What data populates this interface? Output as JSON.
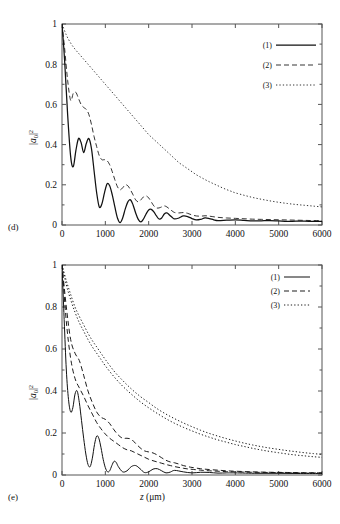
{
  "figure": {
    "panels": [
      {
        "id": "d",
        "label": "(d)",
        "ylabel_html": "|<i>a</i><sub>0</sub>|<sup>2</sup>",
        "xlabel": "",
        "legend": [
          {
            "key": "(1)",
            "style": "solid"
          },
          {
            "key": "(2)",
            "style": "dashed"
          },
          {
            "key": "(3)",
            "style": "dotted"
          }
        ]
      },
      {
        "id": "e",
        "label": "(e)",
        "ylabel_html": "|<i>a</i><sub>0</sub>|<sup>2</sup>",
        "xlabel_html": "<i>z</i> (μm)",
        "legend": [
          {
            "key": "(1)",
            "style": "solid"
          },
          {
            "key": "(2)",
            "style": "dashed"
          },
          {
            "key": "(3)",
            "style": "dotted"
          }
        ]
      }
    ],
    "axis": {
      "x_ticks": [
        "0",
        "1000",
        "2000",
        "3000",
        "4000",
        "5000",
        "6000"
      ],
      "y_ticks": [
        "0",
        "0.2",
        "0.4",
        "0.6",
        "0.8",
        "1"
      ],
      "x_values": [
        0,
        1000,
        2000,
        3000,
        4000,
        5000,
        6000
      ],
      "y_values": [
        0,
        0.2,
        0.4,
        0.6,
        0.8,
        1
      ],
      "xlim": [
        0,
        6000
      ],
      "ylim": [
        0,
        1
      ]
    },
    "colors": {
      "line": "#111111",
      "frame": "#555555",
      "background": "#ffffff"
    }
  },
  "chart_data": [
    {
      "type": "line",
      "panel": "d",
      "title": "",
      "xlabel": "z (μm)",
      "ylabel": "|a_0|^2",
      "xlim": [
        0,
        6000
      ],
      "ylim": [
        0,
        1
      ],
      "grid": false,
      "legend_position": "top-right",
      "series": [
        {
          "name": "(1)",
          "style": "solid",
          "x": [
            0,
            60,
            130,
            200,
            260,
            320,
            380,
            440,
            500,
            560,
            620,
            680,
            740,
            800,
            860,
            920,
            980,
            1040,
            1100,
            1160,
            1220,
            1280,
            1340,
            1400,
            1460,
            1520,
            1580,
            1640,
            1700,
            1760,
            1820,
            1880,
            1940,
            2000,
            2060,
            2120,
            2180,
            2240,
            2300,
            2360,
            2420,
            2480,
            2540,
            2600,
            2700,
            2800,
            2900,
            3000,
            3100,
            3200,
            3300,
            3400,
            3500,
            3600,
            3800,
            4000,
            4200,
            4400,
            4600,
            4800,
            5000,
            5200,
            5400,
            5600,
            5800,
            6000
          ],
          "y": [
            1.0,
            0.82,
            0.55,
            0.34,
            0.29,
            0.37,
            0.43,
            0.41,
            0.36,
            0.405,
            0.43,
            0.38,
            0.27,
            0.16,
            0.09,
            0.105,
            0.16,
            0.205,
            0.195,
            0.15,
            0.09,
            0.035,
            0.012,
            0.035,
            0.08,
            0.115,
            0.125,
            0.1,
            0.06,
            0.028,
            0.015,
            0.03,
            0.055,
            0.075,
            0.078,
            0.065,
            0.045,
            0.03,
            0.035,
            0.055,
            0.06,
            0.05,
            0.038,
            0.03,
            0.035,
            0.045,
            0.042,
            0.032,
            0.025,
            0.028,
            0.035,
            0.032,
            0.026,
            0.022,
            0.024,
            0.026,
            0.023,
            0.02,
            0.021,
            0.022,
            0.02,
            0.018,
            0.019,
            0.019,
            0.018,
            0.018
          ]
        },
        {
          "name": "(2)",
          "style": "dashed",
          "x": [
            0,
            60,
            130,
            200,
            260,
            320,
            380,
            440,
            500,
            560,
            620,
            680,
            740,
            800,
            860,
            920,
            980,
            1040,
            1100,
            1160,
            1220,
            1280,
            1340,
            1400,
            1460,
            1520,
            1580,
            1640,
            1700,
            1760,
            1820,
            1880,
            1940,
            2000,
            2060,
            2120,
            2180,
            2240,
            2300,
            2360,
            2420,
            2480,
            2540,
            2600,
            2700,
            2800,
            2900,
            3000,
            3100,
            3200,
            3300,
            3400,
            3600,
            3800,
            4000,
            4200,
            4400,
            4600,
            4800,
            5000,
            5200,
            5400,
            5600,
            5800,
            6000
          ],
          "y": [
            1.0,
            0.88,
            0.72,
            0.62,
            0.655,
            0.66,
            0.63,
            0.6,
            0.585,
            0.575,
            0.55,
            0.5,
            0.44,
            0.39,
            0.345,
            0.325,
            0.325,
            0.32,
            0.3,
            0.265,
            0.225,
            0.19,
            0.175,
            0.185,
            0.2,
            0.195,
            0.175,
            0.15,
            0.125,
            0.115,
            0.125,
            0.14,
            0.145,
            0.135,
            0.115,
            0.095,
            0.085,
            0.085,
            0.09,
            0.095,
            0.09,
            0.08,
            0.07,
            0.062,
            0.06,
            0.062,
            0.058,
            0.05,
            0.045,
            0.044,
            0.046,
            0.044,
            0.038,
            0.035,
            0.033,
            0.031,
            0.029,
            0.028,
            0.027,
            0.026,
            0.025,
            0.024,
            0.023,
            0.022,
            0.022
          ]
        },
        {
          "name": "(3)",
          "style": "dotted",
          "x": [
            0,
            100,
            200,
            300,
            400,
            500,
            600,
            700,
            800,
            900,
            1000,
            1100,
            1200,
            1300,
            1400,
            1500,
            1600,
            1700,
            1800,
            1900,
            2000,
            2100,
            2200,
            2300,
            2400,
            2500,
            2600,
            2700,
            2800,
            2900,
            3000,
            3100,
            3200,
            3300,
            3400,
            3500,
            3600,
            3700,
            3800,
            3900,
            4000,
            4200,
            4400,
            4600,
            4800,
            5000,
            5200,
            5400,
            5600,
            5800,
            6000
          ],
          "y": [
            1.0,
            0.945,
            0.905,
            0.875,
            0.85,
            0.825,
            0.8,
            0.775,
            0.75,
            0.725,
            0.7,
            0.675,
            0.65,
            0.625,
            0.6,
            0.575,
            0.55,
            0.525,
            0.5,
            0.475,
            0.45,
            0.43,
            0.41,
            0.39,
            0.37,
            0.35,
            0.33,
            0.31,
            0.295,
            0.28,
            0.265,
            0.25,
            0.238,
            0.226,
            0.215,
            0.205,
            0.195,
            0.185,
            0.176,
            0.168,
            0.16,
            0.148,
            0.137,
            0.128,
            0.12,
            0.113,
            0.107,
            0.102,
            0.098,
            0.094,
            0.09
          ]
        }
      ]
    },
    {
      "type": "line",
      "panel": "e",
      "title": "",
      "xlabel": "z (μm)",
      "ylabel": "|a_0|^2",
      "xlim": [
        0,
        6000
      ],
      "ylim": [
        0,
        1
      ],
      "grid": false,
      "legend_position": "top-right",
      "series": [
        {
          "name": "(1)",
          "style": "solid",
          "x": [
            0,
            50,
            100,
            150,
            200,
            250,
            300,
            350,
            400,
            450,
            500,
            550,
            600,
            650,
            700,
            750,
            800,
            850,
            900,
            950,
            1000,
            1050,
            1100,
            1150,
            1200,
            1250,
            1300,
            1400,
            1500,
            1600,
            1700,
            1800,
            1900,
            2000,
            2100,
            2200,
            2300,
            2400,
            2500,
            2600,
            2800,
            3000,
            3200,
            3400,
            3600,
            3800,
            4000,
            4500,
            5000,
            5500,
            6000
          ],
          "y": [
            1.0,
            0.74,
            0.5,
            0.36,
            0.3,
            0.32,
            0.385,
            0.4,
            0.345,
            0.26,
            0.175,
            0.1,
            0.05,
            0.04,
            0.08,
            0.145,
            0.185,
            0.175,
            0.13,
            0.075,
            0.035,
            0.015,
            0.02,
            0.045,
            0.065,
            0.06,
            0.04,
            0.015,
            0.02,
            0.04,
            0.045,
            0.03,
            0.012,
            0.015,
            0.028,
            0.03,
            0.02,
            0.01,
            0.014,
            0.022,
            0.015,
            0.01,
            0.013,
            0.012,
            0.009,
            0.01,
            0.01,
            0.008,
            0.008,
            0.007,
            0.007
          ]
        },
        {
          "name": "(2)",
          "style": "dashed",
          "x": [
            0,
            100,
            200,
            300,
            400,
            500,
            600,
            700,
            800,
            900,
            1000,
            1100,
            1200,
            1300,
            1400,
            1500,
            1600,
            1700,
            1800,
            1900,
            2000,
            2100,
            2200,
            2300,
            2400,
            2500,
            2600,
            2700,
            2800,
            2900,
            3000,
            3200,
            3400,
            3600,
            3800,
            4000,
            4400,
            4800,
            5200,
            5600,
            6000
          ],
          "y": [
            1.0,
            0.73,
            0.555,
            0.46,
            0.415,
            0.375,
            0.33,
            0.29,
            0.25,
            0.22,
            0.195,
            0.175,
            0.16,
            0.145,
            0.13,
            0.12,
            0.115,
            0.105,
            0.095,
            0.085,
            0.075,
            0.068,
            0.062,
            0.056,
            0.05,
            0.045,
            0.04,
            0.036,
            0.032,
            0.029,
            0.027,
            0.023,
            0.02,
            0.018,
            0.016,
            0.015,
            0.013,
            0.012,
            0.011,
            0.01,
            0.01
          ]
        },
        {
          "name": "(2b)",
          "style": "dashed",
          "x": [
            0,
            100,
            200,
            300,
            400,
            500,
            600,
            700,
            800,
            900,
            1000,
            1100,
            1200,
            1300,
            1400,
            1500,
            1600,
            1700,
            1800,
            1900,
            2000,
            2100,
            2200,
            2300,
            2400,
            2500,
            2600,
            2700,
            2800,
            2900,
            3000,
            3200,
            3400,
            3600,
            3800,
            4000,
            4400,
            4800,
            5200,
            5600,
            6000
          ],
          "y": [
            1.0,
            0.8,
            0.645,
            0.58,
            0.545,
            0.475,
            0.4,
            0.345,
            0.3,
            0.275,
            0.265,
            0.245,
            0.215,
            0.19,
            0.175,
            0.175,
            0.17,
            0.15,
            0.13,
            0.115,
            0.11,
            0.105,
            0.095,
            0.082,
            0.07,
            0.062,
            0.058,
            0.052,
            0.045,
            0.04,
            0.036,
            0.03,
            0.026,
            0.023,
            0.02,
            0.018,
            0.015,
            0.013,
            0.012,
            0.011,
            0.01
          ]
        },
        {
          "name": "(3)",
          "style": "dotted",
          "x": [
            0,
            100,
            200,
            300,
            400,
            500,
            600,
            700,
            800,
            900,
            1000,
            1200,
            1400,
            1600,
            1800,
            2000,
            2200,
            2400,
            2600,
            2800,
            3000,
            3200,
            3400,
            3600,
            3800,
            4000,
            4200,
            4400,
            4600,
            4800,
            5000,
            5200,
            5400,
            5600,
            5800,
            6000
          ],
          "y": [
            1.0,
            0.925,
            0.86,
            0.8,
            0.755,
            0.715,
            0.675,
            0.64,
            0.61,
            0.58,
            0.55,
            0.495,
            0.45,
            0.41,
            0.375,
            0.345,
            0.315,
            0.29,
            0.268,
            0.248,
            0.23,
            0.213,
            0.198,
            0.185,
            0.173,
            0.162,
            0.152,
            0.143,
            0.135,
            0.128,
            0.122,
            0.116,
            0.111,
            0.106,
            0.102,
            0.098
          ]
        },
        {
          "name": "(3b)",
          "style": "dotted",
          "x": [
            0,
            100,
            200,
            300,
            400,
            500,
            600,
            700,
            800,
            900,
            1000,
            1200,
            1400,
            1600,
            1800,
            2000,
            2200,
            2400,
            2600,
            2800,
            3000,
            3200,
            3400,
            3600,
            3800,
            4000,
            4200,
            4400,
            4600,
            4800,
            5000,
            5200,
            5400,
            5600,
            5800,
            6000
          ],
          "y": [
            1.0,
            0.905,
            0.835,
            0.775,
            0.725,
            0.685,
            0.645,
            0.61,
            0.58,
            0.55,
            0.52,
            0.468,
            0.423,
            0.385,
            0.35,
            0.32,
            0.293,
            0.268,
            0.246,
            0.227,
            0.21,
            0.194,
            0.18,
            0.167,
            0.156,
            0.145,
            0.136,
            0.127,
            0.119,
            0.112,
            0.106,
            0.1,
            0.095,
            0.091,
            0.087,
            0.084
          ]
        }
      ]
    }
  ]
}
